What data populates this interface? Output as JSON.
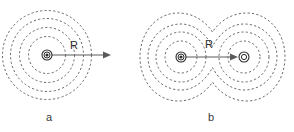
{
  "figure": {
    "background_color": "#ffffff",
    "contour_color": "#595959",
    "nucleus_color": "#2b2b2b",
    "vector_color": "#5a5a5a",
    "label_color": "#2b2b2b",
    "width": 294,
    "height": 132
  },
  "panels": [
    {
      "id": "a",
      "caption": "a",
      "caption_x": 49,
      "caption_y": 121,
      "description": "single atom with four concentric dashed density contours and outward radius vector R",
      "centers": [
        {
          "name": "nucleus-a",
          "x": 47,
          "y": 55,
          "ring_r": 5.0,
          "core_r": 2.0,
          "glyph": "atom-dot"
        }
      ],
      "contours": [
        {
          "cx": 47,
          "cy": 55,
          "r": 18.5
        },
        {
          "cx": 47,
          "cy": 55,
          "r": 27.5
        },
        {
          "cx": 47,
          "cy": 55,
          "r": 36.5
        },
        {
          "cx": 47,
          "cy": 55,
          "r": 44.5
        }
      ],
      "vector": {
        "label": "R",
        "label_x": 70,
        "label_y": 49,
        "x1": 47,
        "y1": 55,
        "x2": 111,
        "y2": 55,
        "arrow": "end"
      }
    },
    {
      "id": "b",
      "caption": "b",
      "caption_x": 211,
      "caption_y": 121,
      "description": "two atoms separated by distance R; inner dashed contours remain circular while outer contours merge into a peanut shape",
      "centers": [
        {
          "name": "nucleus-b-left",
          "x": 181,
          "y": 57,
          "ring_r": 5.0,
          "core_r": 2.0,
          "glyph": "atom-dot"
        },
        {
          "name": "nucleus-b-right",
          "x": 244,
          "y": 57,
          "ring_r": 5.0,
          "core_r": 2.0,
          "glyph": "atom-ring"
        }
      ],
      "contours": [
        {
          "cx": 181,
          "cy": 57,
          "r": 16.0,
          "type": "circle"
        },
        {
          "cx": 244,
          "cy": 57,
          "r": 16.0,
          "type": "circle"
        },
        {
          "cx": 181,
          "cy": 57,
          "r": 25.0,
          "type": "circle"
        },
        {
          "cx": 244,
          "cy": 57,
          "r": 25.0,
          "type": "circle"
        },
        {
          "type": "merged",
          "level": 3,
          "lobe_r": 33.0,
          "waist": 10.0
        },
        {
          "type": "merged",
          "level": 4,
          "lobe_r": 42.0,
          "waist": 26.0
        }
      ],
      "vector": {
        "label": "R",
        "label_x": 208,
        "label_y": 49,
        "x1": 181,
        "y1": 57,
        "x2": 244,
        "y2": 57,
        "arrow": "end"
      }
    }
  ],
  "labels": {
    "radius_symbol": "R",
    "caption_a": "a",
    "caption_b": "b"
  }
}
